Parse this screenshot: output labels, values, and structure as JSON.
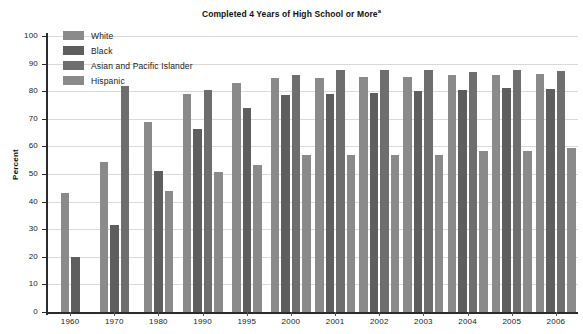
{
  "chart_data": {
    "type": "bar",
    "title": "Completed 4 Years of High School or More",
    "title_superscript": "a",
    "xlabel": "",
    "ylabel": "Percent",
    "ylim": [
      0,
      100
    ],
    "ytick_step": 10,
    "yticks": [
      0,
      10,
      20,
      30,
      40,
      50,
      60,
      70,
      80,
      90,
      100
    ],
    "grid": true,
    "legend_position": "top-left",
    "categories": [
      "1960",
      "1970",
      "1980",
      "1990",
      "1995",
      "2000",
      "2001",
      "2002",
      "2003",
      "2004",
      "2005",
      "2006"
    ],
    "series": [
      {
        "name": "White",
        "color": "#8a8a8a",
        "values": [
          43.2,
          54.5,
          68.8,
          79.1,
          83.0,
          84.9,
          84.9,
          85.1,
          85.1,
          85.8,
          85.7,
          86.1
        ]
      },
      {
        "name": "Black",
        "color": "#5e5e5e",
        "values": [
          20.1,
          31.4,
          51.2,
          66.2,
          73.8,
          78.5,
          79.0,
          79.2,
          80.0,
          80.6,
          81.1,
          80.7
        ]
      },
      {
        "name": "Asian and Pacific Islander",
        "color": "#6e6e6e",
        "values": [
          null,
          82.0,
          null,
          80.4,
          null,
          85.7,
          87.8,
          87.8,
          87.6,
          86.8,
          87.6,
          87.4
        ]
      },
      {
        "name": "Hispanic",
        "color": "#8a8a8a",
        "values": [
          null,
          null,
          44.0,
          50.8,
          53.4,
          57.0,
          56.8,
          57.0,
          57.0,
          58.4,
          58.5,
          59.3
        ]
      }
    ]
  },
  "yticks_text": [
    "0",
    "10",
    "20",
    "30",
    "40",
    "50",
    "60",
    "70",
    "80",
    "90",
    "100"
  ],
  "legend": {
    "items": [
      {
        "label": "White"
      },
      {
        "label": "Black"
      },
      {
        "label": "Asian and Pacific Islander"
      },
      {
        "label": "Hispanic"
      }
    ]
  }
}
